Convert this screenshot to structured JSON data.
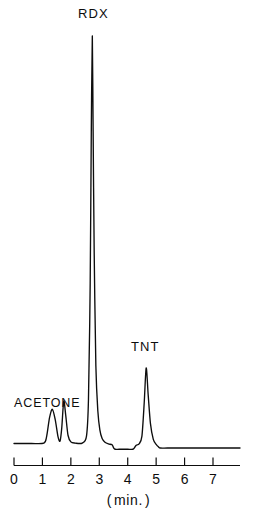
{
  "figure": {
    "kind": "chromatogram",
    "background_color": "#ffffff",
    "trace_color": "#0d0d0d",
    "axis_color": "#0d0d0d"
  },
  "labels": {
    "rdx": "RDX",
    "tnt": "TNT",
    "acetone": "ACETONE",
    "axis_title_open": "(",
    "axis_title_text": "min.",
    "axis_title_close": ")",
    "axis_title_full": "( min. )"
  },
  "chart_data": {
    "type": "line",
    "title": "",
    "subtitle": "",
    "xlabel": "( min. )",
    "ylabel": "",
    "xlim": [
      0,
      8
    ],
    "ylim": [
      0,
      100
    ],
    "grid": false,
    "legend_position": "none",
    "xticks": [
      0,
      1,
      2,
      3,
      4,
      5,
      6,
      7
    ],
    "xtick_labels": [
      "0",
      "1",
      "2",
      "3",
      "4",
      "5",
      "6",
      "7"
    ],
    "yticks": [],
    "ytick_labels": [],
    "series": [
      {
        "name": "detector response",
        "x": [
          0.0,
          0.6,
          1.05,
          1.15,
          1.25,
          1.35,
          1.45,
          1.55,
          1.62,
          1.68,
          1.75,
          1.82,
          1.9,
          2.0,
          2.15,
          2.4,
          2.55,
          2.62,
          2.68,
          2.72,
          2.755,
          2.78,
          2.82,
          2.88,
          2.95,
          3.02,
          3.1,
          3.2,
          3.32,
          3.45,
          3.5,
          3.56,
          3.7,
          4.0,
          4.18,
          4.24,
          4.3,
          4.4,
          4.5,
          4.58,
          4.65,
          4.72,
          4.8,
          4.9,
          5.0,
          5.08,
          5.15,
          5.4,
          6.0,
          6.8,
          7.0,
          7.95
        ],
        "y": [
          1.2,
          1.2,
          1.3,
          3.0,
          7.5,
          9.5,
          7.0,
          2.8,
          1.8,
          5.0,
          11.5,
          8.0,
          3.2,
          1.6,
          1.3,
          1.3,
          3.0,
          12.0,
          40.0,
          78.0,
          100.0,
          80.0,
          48.0,
          20.0,
          9.0,
          4.5,
          2.4,
          1.5,
          1.1,
          0.9,
          0.2,
          -0.2,
          -0.2,
          -0.2,
          -0.2,
          0.2,
          0.8,
          1.1,
          3.0,
          11.0,
          19.5,
          13.0,
          6.0,
          2.2,
          1.0,
          0.4,
          0.1,
          0.1,
          0.1,
          0.1,
          0.1,
          0.1
        ]
      }
    ],
    "annotations": [
      {
        "text": "RDX",
        "x": 2.75,
        "y": 100,
        "note": "peak label above tallest peak"
      },
      {
        "text": "TNT",
        "x": 4.65,
        "y": 19.5,
        "note": "peak label above third peak"
      },
      {
        "text": "ACETONE",
        "x": 1.55,
        "y": 11.5,
        "note": "label spanning first peak doublet"
      }
    ],
    "peaks": [
      {
        "label": "",
        "retention_time_min": 1.35,
        "relative_height": 9.5
      },
      {
        "label": "ACETONE",
        "retention_time_min": 1.75,
        "relative_height": 11.5
      },
      {
        "label": "RDX",
        "retention_time_min": 2.75,
        "relative_height": 100.0
      },
      {
        "label": "TNT",
        "retention_time_min": 4.65,
        "relative_height": 19.5
      }
    ]
  }
}
